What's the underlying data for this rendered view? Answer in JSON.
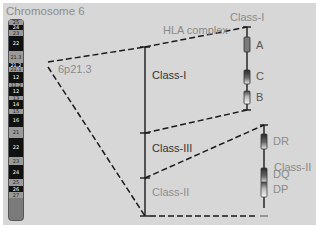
{
  "title": "Chromosome 6",
  "locus_label": "6p21.3",
  "hla_complex_label": "HLA complex",
  "main_axis": {
    "regions": [
      {
        "label": "Class-I",
        "tone": "dark"
      },
      {
        "label": "Class-III",
        "tone": "dark"
      },
      {
        "label": "Class-II",
        "tone": "muted"
      }
    ]
  },
  "class_i_detail": {
    "label": "Class-I",
    "genes": [
      {
        "name": "A"
      },
      {
        "name": "C"
      },
      {
        "name": "B"
      }
    ]
  },
  "class_ii_detail": {
    "label": "Class-II",
    "genes": [
      {
        "name": "DR"
      },
      {
        "name": "DQ"
      },
      {
        "name": "DP"
      }
    ]
  },
  "ideogram": {
    "bands": [
      {
        "name": "25",
        "shade": "gray"
      },
      {
        "name": "24",
        "shade": "black"
      },
      {
        "name": "23",
        "shade": "gray"
      },
      {
        "name": "22",
        "shade": "black"
      },
      {
        "name": "21.3",
        "shade": "gray"
      },
      {
        "name": "21.2",
        "shade": "black"
      },
      {
        "name": "21.1",
        "shade": "gray"
      },
      {
        "name": "12",
        "shade": "black"
      },
      {
        "name": "11.2",
        "shade": "gray"
      },
      {
        "name": "12",
        "shade": "black"
      },
      {
        "name": "13",
        "shade": "gray"
      },
      {
        "name": "14",
        "shade": "black"
      },
      {
        "name": "15",
        "shade": "gray"
      },
      {
        "name": "16",
        "shade": "black"
      },
      {
        "name": "21",
        "shade": "gray"
      },
      {
        "name": "22",
        "shade": "black"
      },
      {
        "name": "23",
        "shade": "gray"
      },
      {
        "name": "24",
        "shade": "black"
      },
      {
        "name": "25",
        "shade": "gray"
      },
      {
        "name": "26",
        "shade": "black"
      },
      {
        "name": "27",
        "shade": "gray"
      }
    ]
  },
  "colors": {
    "panel_bg": "#d7d7d7",
    "line": "#1a1a1a",
    "band_black": "#111111",
    "band_gray": "#9a9a9a",
    "label_gray": "#8a8a8a"
  }
}
